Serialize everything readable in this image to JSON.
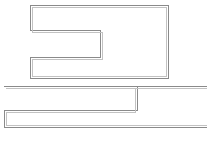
{
  "document": {
    "title": "Two interlocking stepped polygon outlines",
    "background_color": "#ffffff",
    "width": 207,
    "height": 147,
    "text_labels": [],
    "annotations": []
  },
  "drawing": {
    "type": "line-drawing",
    "description": "Technical line drawing: two Z-stepped rectangular block outlines, upper and lower, drawn with thin gray double lines on a white field. No text, no axes, no legend.",
    "stroke_color_primary": "#8a8a8a",
    "stroke_color_secondary": "#b8b8b8",
    "stroke_width": 1,
    "fill": "none",
    "shapes": [
      {
        "id": "upper-stepped-block",
        "name": "upper-stepped-outline",
        "kind": "polygon",
        "closed": true,
        "stroke": "#8a8a8a",
        "points": "30,5 168,5 168,78 30,78 30,57 100,57 100,30 30,30",
        "inner_offset_points": "32,7 166,7 166,76 32,76 32,59 102,59 102,32 32,32"
      },
      {
        "id": "lower-stepped-block",
        "name": "lower-stepped-outline",
        "kind": "polygon",
        "closed": true,
        "stroke": "#8a8a8a",
        "points": "4,86 207,86 207,127 4,127 4,110 70,110 70,110 137,110 137,86",
        "inner_offset_points": "6,88 207,88 207,125 6,125 6,112 72,112 72,112 135,112 135,88"
      }
    ],
    "segments": [
      {
        "id": "upper-top-edge",
        "name": "upper-top-edge",
        "x1": 30,
        "y1": 5,
        "x2": 168,
        "y2": 5
      },
      {
        "id": "upper-right-edge",
        "name": "upper-right-edge",
        "x1": 168,
        "y1": 5,
        "x2": 168,
        "y2": 78
      },
      {
        "id": "upper-bottom-edge",
        "name": "upper-bottom-edge",
        "x1": 168,
        "y1": 78,
        "x2": 30,
        "y2": 78
      },
      {
        "id": "upper-left-edge",
        "name": "upper-left-edge",
        "x1": 30,
        "y1": 78,
        "x2": 30,
        "y2": 5
      },
      {
        "id": "upper-notch-top",
        "name": "upper-notch-top-edge",
        "x1": 100,
        "y1": 30,
        "x2": 168,
        "y2": 30
      },
      {
        "id": "upper-notch-vertical",
        "name": "upper-notch-vertical-edge",
        "x1": 100,
        "y1": 30,
        "x2": 100,
        "y2": 57
      },
      {
        "id": "upper-notch-bottom",
        "name": "upper-notch-bottom-edge",
        "x1": 30,
        "y1": 57,
        "x2": 100,
        "y2": 57
      },
      {
        "id": "lower-top-edge",
        "name": "lower-top-edge",
        "x1": 4,
        "y1": 86,
        "x2": 207,
        "y2": 86
      },
      {
        "id": "lower-bottom-edge",
        "name": "lower-bottom-edge",
        "x1": 4,
        "y1": 127,
        "x2": 207,
        "y2": 127
      },
      {
        "id": "lower-left-edge",
        "name": "lower-left-edge",
        "x1": 4,
        "y1": 86,
        "x2": 4,
        "y2": 127
      },
      {
        "id": "lower-notch-vertical",
        "name": "lower-notch-left-vertical-edge",
        "x1": 70,
        "y1": 110,
        "x2": 70,
        "y2": 127
      },
      {
        "id": "lower-notch-horizontal",
        "name": "lower-notch-horizontal-edge",
        "x1": 70,
        "y1": 110,
        "x2": 137,
        "y2": 110
      },
      {
        "id": "lower-notch-right",
        "name": "lower-notch-right-vertical-edge",
        "x1": 137,
        "y1": 86,
        "x2": 137,
        "y2": 110
      }
    ]
  }
}
